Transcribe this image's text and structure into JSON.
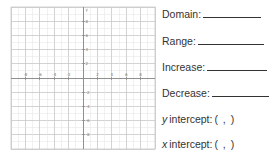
{
  "graph": {
    "x_axis_label": "x",
    "y_axis_label": "y",
    "x_ticks": [
      {
        "value": -8,
        "label": "-8"
      },
      {
        "value": -6,
        "label": "-6"
      },
      {
        "value": -4,
        "label": "-4"
      },
      {
        "value": -2,
        "label": "-2"
      },
      {
        "value": 2,
        "label": "2"
      },
      {
        "value": 4,
        "label": "4"
      },
      {
        "value": 6,
        "label": "6"
      },
      {
        "value": 8,
        "label": "8"
      }
    ],
    "y_ticks": [
      {
        "value": 8,
        "label": "8"
      },
      {
        "value": 6,
        "label": "6"
      },
      {
        "value": 4,
        "label": "4"
      },
      {
        "value": 2,
        "label": "2"
      },
      {
        "value": -2,
        "label": "-2"
      },
      {
        "value": -4,
        "label": "-4"
      },
      {
        "value": -6,
        "label": "-6"
      },
      {
        "value": -8,
        "label": "-8"
      }
    ],
    "range": [
      -10,
      10
    ],
    "colors": {
      "minor_grid": "#e4e4e4",
      "major_grid": "#c8c8c8",
      "axis": "#888888"
    }
  },
  "worksheet": {
    "domain_label": "Domain:",
    "range_label": "Range:",
    "increase_label": "Increase:",
    "decrease_label": "Decrease:",
    "y_intercept_var": "y",
    "y_intercept_label": "intercept:",
    "y_intercept_value": "(   ,   )",
    "x_intercept_var": "x",
    "x_intercept_label": "intercept:",
    "x_intercept_value": "(   ,   )"
  }
}
